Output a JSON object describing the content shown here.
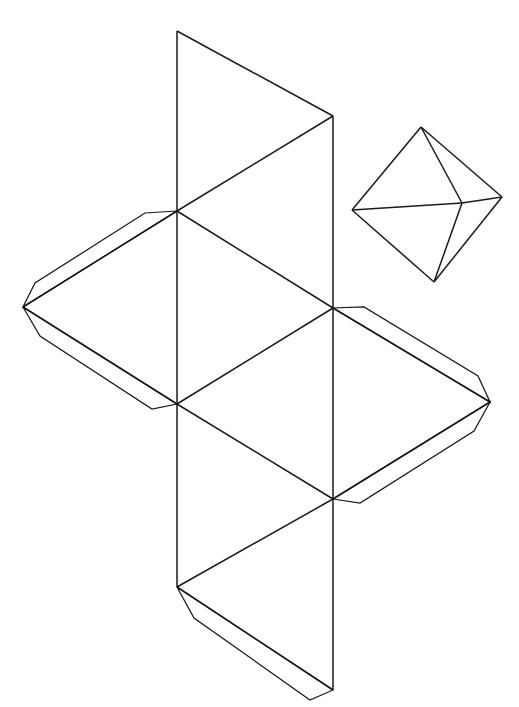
{
  "page": {
    "background_color": "#ffffff",
    "line_color": "#1a1a1a",
    "width": 519,
    "height": 707,
    "caption": "",
    "caption_color": "#cfcfd6"
  },
  "figure": {
    "title": "",
    "type": "papercraft-net",
    "solid_name": "octahedron",
    "face_count": 8,
    "face_shape": "equilateral-triangle",
    "tab_count": 6
  },
  "net": {
    "label": "octahedron-net",
    "description": "Unfolded octahedron template with glue tabs",
    "strip_faces": [
      {
        "id": "face-1",
        "points": "177,31 333,116 177,211"
      },
      {
        "id": "face-2",
        "points": "333,116 333,308 177,211"
      },
      {
        "id": "face-3",
        "points": "177,211 333,308 177,404"
      },
      {
        "id": "face-4",
        "points": "333,308 333,499 177,404"
      },
      {
        "id": "face-5",
        "points": "177,404 333,499 177,587"
      },
      {
        "id": "face-6",
        "points": "333,499 333,690 177,587"
      }
    ],
    "wing_faces": [
      {
        "id": "face-7",
        "points": "177,211 23,307 177,404"
      },
      {
        "id": "face-8",
        "points": "333,308 490,402 333,499"
      }
    ],
    "tabs": [
      {
        "id": "tab-left-upper",
        "points": "177,211 23,307 35,283 145,213"
      },
      {
        "id": "tab-left-lower",
        "points": "23,307 177,404 152,409 40,336"
      },
      {
        "id": "tab-right-upper",
        "points": "333,308 490,402 478,376 364,307"
      },
      {
        "id": "tab-right-lower",
        "points": "490,402 333,499 360,503 474,431"
      },
      {
        "id": "tab-bottom",
        "points": "177,587 333,690 310,700 194,618"
      }
    ],
    "fold_lines": [
      {
        "id": "fold-vertical-left",
        "points": "177,31 177,587"
      },
      {
        "id": "fold-vertical-right",
        "points": "333,116 333,690"
      },
      {
        "id": "fold-diag-1",
        "points": "177,31 333,116"
      },
      {
        "id": "fold-diag-2",
        "points": "333,116 177,211"
      },
      {
        "id": "fold-diag-3",
        "points": "177,211 333,308"
      },
      {
        "id": "fold-diag-4",
        "points": "333,308 177,404"
      },
      {
        "id": "fold-diag-5",
        "points": "177,404 333,499"
      },
      {
        "id": "fold-diag-6",
        "points": "333,499 177,587"
      },
      {
        "id": "fold-diag-7",
        "points": "177,587 333,690"
      },
      {
        "id": "fold-wing-left-top",
        "points": "177,211 23,307"
      },
      {
        "id": "fold-wing-left-bottom",
        "points": "23,307 177,404"
      },
      {
        "id": "fold-wing-right-top",
        "points": "333,308 490,402"
      },
      {
        "id": "fold-wing-right-bottom",
        "points": "490,402 333,499"
      }
    ]
  },
  "preview": {
    "label": "octahedron-preview",
    "description": "Assembled octahedron shown in 3D",
    "vertices": {
      "top": "421,127",
      "left": "352,210",
      "right": "502,197",
      "bottom": "434,282",
      "center": "462,203"
    },
    "edges": [
      {
        "id": "edge-top-left",
        "points": "421,127 352,210"
      },
      {
        "id": "edge-top-right",
        "points": "421,127 502,197"
      },
      {
        "id": "edge-top-center",
        "points": "421,127 462,203"
      },
      {
        "id": "edge-left-bottom",
        "points": "352,210 434,282"
      },
      {
        "id": "edge-right-bottom",
        "points": "502,197 434,282"
      },
      {
        "id": "edge-center-bottom",
        "points": "462,203 434,282"
      },
      {
        "id": "edge-left-center",
        "points": "352,210 462,203"
      },
      {
        "id": "edge-center-right",
        "points": "462,203 502,197"
      }
    ]
  }
}
